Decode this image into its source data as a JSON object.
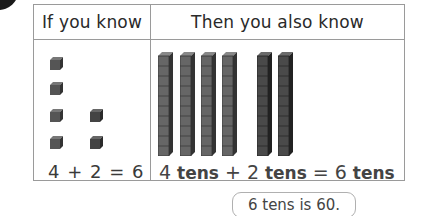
{
  "badge": {
    "icon": "black-circle-corner"
  },
  "table": {
    "headers": {
      "left": "If you know",
      "right": "Then you also know"
    },
    "left_column": {
      "icon": "unit-cube-icon",
      "groups": [
        {
          "count": 4,
          "label": "4"
        },
        {
          "count": 2,
          "label": "2"
        }
      ],
      "equation": "4 + 2 = 6"
    },
    "right_column": {
      "icon": "ten-rod-icon",
      "groups": [
        {
          "count": 4,
          "label": "4 tens",
          "color": "#666666"
        },
        {
          "count": 2,
          "label": "2 tens",
          "color": "#4a4a4a"
        }
      ],
      "equation": {
        "a_num": "4",
        "a_unit": " tens",
        "plus": " + ",
        "b_num": "2",
        "b_unit": " tens",
        "equals": " = ",
        "c_num": "6",
        "c_unit": " tens"
      }
    }
  },
  "callout": {
    "text": "6 tens is 60."
  },
  "colors": {
    "border": "#9a9a9a",
    "cube_fill": "#555555",
    "rod_light": "#666666",
    "rod_dark": "#4a4a4a"
  }
}
